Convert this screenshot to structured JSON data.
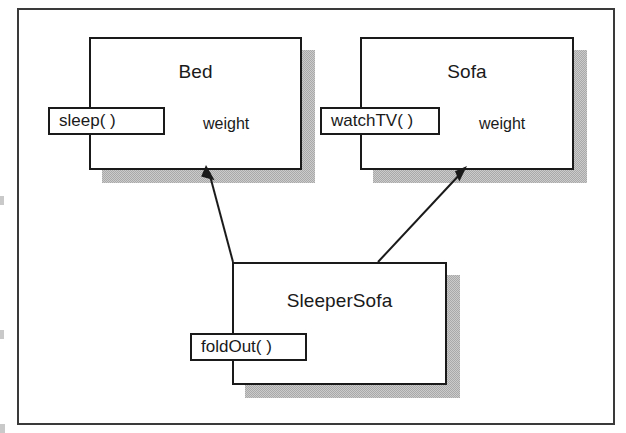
{
  "diagram": {
    "type": "uml-class-diagram",
    "title": "",
    "background_color": "#ffffff",
    "frame_color": "#3a3a3a",
    "box_fill": "#ffffff",
    "box_border_color": "#1a1a1a",
    "shadow_color": "#a9a9a9",
    "arrow_color": "#1a1a1a",
    "classes": [
      {
        "id": "bed",
        "name": "Bed",
        "attributes": [
          "weight"
        ],
        "methods": [
          "sleep( )"
        ]
      },
      {
        "id": "sofa",
        "name": "Sofa",
        "attributes": [
          "weight"
        ],
        "methods": [
          "watchTV( )"
        ]
      },
      {
        "id": "sleepersofa",
        "name": "SleeperSofa",
        "attributes": [],
        "methods": [
          "foldOut( )"
        ]
      }
    ],
    "relationships": [
      {
        "id": "sleepersofa-to-bed",
        "kind": "inheritance",
        "from": "SleeperSofa",
        "to": "Bed",
        "arrowhead": "solid"
      },
      {
        "id": "sleepersofa-to-sofa",
        "kind": "inheritance",
        "from": "SleeperSofa",
        "to": "Sofa",
        "arrowhead": "solid"
      }
    ]
  }
}
